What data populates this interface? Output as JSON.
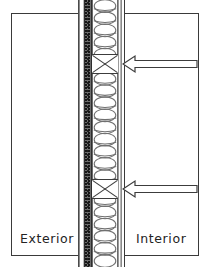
{
  "diagram": {
    "zones": {
      "exterior_label": "Exterior",
      "interior_label": "Interior"
    },
    "layers": [
      {
        "id": "siding-outer",
        "name": "Exterior cladding",
        "left_px": 78,
        "width_px": 2,
        "fill": "#fdfdfd"
      },
      {
        "id": "airgap",
        "name": "Air gap",
        "left_px": 80,
        "width_px": 4,
        "fill": "#ffffff"
      },
      {
        "id": "sheathing",
        "name": "Sheathing / weather membrane",
        "left_px": 84,
        "width_px": 8,
        "fill": "#6d6d6d"
      },
      {
        "id": "cavity",
        "name": "Stud cavity with batt insulation",
        "left_px": 92,
        "width_px": 26,
        "fill": "#ffffff"
      },
      {
        "id": "vapour",
        "name": "Vapour retarder",
        "left_px": 118,
        "width_px": 3,
        "fill": "#fcfcfc"
      },
      {
        "id": "drywall",
        "name": "Interior finish board",
        "left_px": 121,
        "width_px": 4,
        "fill": "#ffffff"
      }
    ],
    "blocking": [
      {
        "id": "blocking-upper",
        "name": "Blocking with X-brace",
        "top_px": 54,
        "height_px": 20
      },
      {
        "id": "blocking-lower",
        "name": "Blocking with X-brace",
        "top_px": 179,
        "height_px": 20
      }
    ],
    "arrows": [
      {
        "id": "arrow-upper",
        "direction": "left",
        "top_px": 53,
        "label": ""
      },
      {
        "id": "arrow-lower",
        "direction": "left",
        "top_px": 178,
        "label": ""
      }
    ],
    "insulation": {
      "name": "batt-insulation",
      "loop_count": 22,
      "stroke": "#707070"
    },
    "colors": {
      "border": "#3a3a3a",
      "sheathing_dark": "#6d6d6d",
      "line": "#3c3c3c",
      "text": "#232323",
      "background": "#ffffff"
    }
  }
}
